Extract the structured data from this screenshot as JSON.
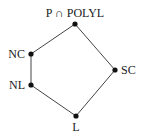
{
  "diagram": {
    "type": "hasse-diagram",
    "nodes": [
      {
        "id": "top",
        "label": "P ∩ POLYL",
        "x": 75,
        "y": 24,
        "lx": 75,
        "ly": 17,
        "anchor": "middle"
      },
      {
        "id": "nc",
        "label": "NC",
        "x": 31,
        "y": 54,
        "lx": 25,
        "ly": 58,
        "anchor": "end"
      },
      {
        "id": "nl",
        "label": "NL",
        "x": 31,
        "y": 85,
        "lx": 25,
        "ly": 89,
        "anchor": "end"
      },
      {
        "id": "sc",
        "label": "SC",
        "x": 115,
        "y": 70,
        "lx": 121,
        "ly": 74,
        "anchor": "start"
      },
      {
        "id": "l",
        "label": "L",
        "x": 76,
        "y": 116,
        "lx": 76,
        "ly": 131,
        "anchor": "middle"
      }
    ],
    "edges": [
      [
        "top",
        "nc"
      ],
      [
        "nc",
        "nl"
      ],
      [
        "nl",
        "l"
      ],
      [
        "l",
        "sc"
      ],
      [
        "sc",
        "top"
      ]
    ],
    "colors": {
      "edge": "#444444",
      "node": "#111111",
      "text": "#222222"
    }
  }
}
